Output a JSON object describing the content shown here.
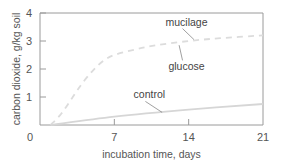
{
  "chart_data": {
    "type": "line",
    "title": "",
    "xlabel": "incubation time, days",
    "ylabel": "carbon dioxide, g/kg soil",
    "xlim": [
      0,
      21
    ],
    "ylim": [
      0,
      4
    ],
    "xticks": [
      0,
      7,
      14,
      21
    ],
    "yticks": [
      1,
      2,
      3,
      4
    ],
    "grid": false,
    "legend": "inline labels",
    "series": [
      {
        "name": "mucilage",
        "style": "dashed",
        "color": "#dcdcdc",
        "x": [
          1,
          2,
          3,
          4,
          5,
          6,
          7,
          9,
          11,
          14,
          17,
          21
        ],
        "y": [
          0.0,
          0.4,
          0.95,
          1.5,
          1.95,
          2.3,
          2.5,
          2.7,
          2.85,
          3.0,
          3.1,
          3.2
        ]
      },
      {
        "name": "glucose",
        "style": "dashed",
        "color": "#dcdcdc",
        "x": [
          1,
          2,
          3,
          4,
          5,
          6,
          7,
          9,
          11,
          14,
          17,
          21
        ],
        "y": [
          0.0,
          0.4,
          0.95,
          1.5,
          1.95,
          2.3,
          2.5,
          2.7,
          2.85,
          3.0,
          3.1,
          3.2
        ]
      },
      {
        "name": "control",
        "style": "solid",
        "color": "#d6d6d6",
        "x": [
          1,
          7,
          14,
          21
        ],
        "y": [
          0.0,
          0.3,
          0.55,
          0.75
        ]
      }
    ],
    "annotations": [
      {
        "text": "mucilage",
        "x": 13.8,
        "y": 3.55,
        "pointer_to": [
          14.5,
          3.05
        ]
      },
      {
        "text": "glucose",
        "x": 13.8,
        "y": 1.95,
        "pointer_to": [
          13.1,
          2.85
        ]
      },
      {
        "text": "control",
        "x": 10.3,
        "y": 0.95,
        "pointer_to": [
          11.5,
          0.45
        ]
      }
    ]
  },
  "axes": {
    "x_tick_labels": [
      "0",
      "7",
      "14",
      "21"
    ],
    "y_tick_labels": [
      "1",
      "2",
      "3",
      "4"
    ]
  }
}
